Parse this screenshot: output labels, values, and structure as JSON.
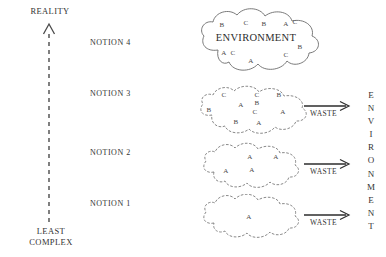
{
  "axis": {
    "top_label": "REALITY",
    "bottom_label_line1": "LEAST",
    "bottom_label_line2": "COMPLEX"
  },
  "right_axis": {
    "vertical_label": "ENVIRONMENT"
  },
  "waste_label": "WASTE",
  "colors": {
    "ink": "#333333",
    "cloud_stroke": "#6b6b6b",
    "background": "#ffffff"
  },
  "rows": [
    {
      "id": "notion-4",
      "label": "NOTION 4",
      "has_waste_arrow": false,
      "env_word": "ENVIRONMENT",
      "letters": [
        "B",
        "C",
        "B",
        "A",
        "C",
        "B",
        "A",
        "C",
        "A",
        "C"
      ],
      "letter_count": 10,
      "complexity_rank": 4
    },
    {
      "id": "notion-3",
      "label": "NOTION 3",
      "has_waste_arrow": true,
      "env_word": "",
      "letters": [
        "C",
        "C",
        "B",
        "B",
        "A",
        "B",
        "A",
        "C",
        "B",
        "A"
      ],
      "letter_count": 10,
      "complexity_rank": 3
    },
    {
      "id": "notion-2",
      "label": "NOTION 2",
      "has_waste_arrow": true,
      "env_word": "",
      "letters": [
        "A",
        "A",
        "A",
        "A"
      ],
      "letter_count": 4,
      "complexity_rank": 2
    },
    {
      "id": "notion-1",
      "label": "NOTION 1",
      "has_waste_arrow": true,
      "env_word": "",
      "letters": [
        "A"
      ],
      "letter_count": 1,
      "complexity_rank": 1
    }
  ]
}
